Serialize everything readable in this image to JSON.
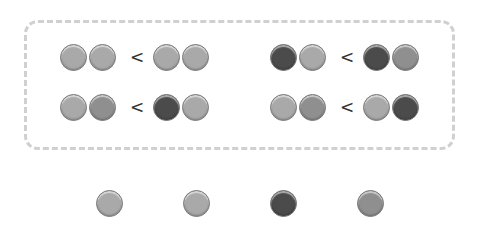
{
  "colors": {
    "light": "#a9a9a9",
    "medium": "#8f8f8f",
    "dark": "#4b4b4b",
    "box_border": "#d0d0d0"
  },
  "comparisons": [
    {
      "left": [
        "light",
        "light"
      ],
      "op": "<",
      "right": [
        "light",
        "light"
      ]
    },
    {
      "left": [
        "dark",
        "light"
      ],
      "op": "<",
      "right": [
        "dark",
        "medium"
      ]
    },
    {
      "left": [
        "light",
        "medium"
      ],
      "op": "<",
      "right": [
        "dark",
        "light"
      ]
    },
    {
      "left": [
        "light",
        "medium"
      ],
      "op": "<",
      "right": [
        "light",
        "dark"
      ]
    }
  ],
  "options": [
    "light",
    "light",
    "dark",
    "medium"
  ]
}
